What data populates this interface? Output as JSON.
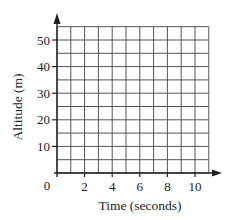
{
  "chart_data": {
    "type": "line",
    "title": "",
    "xlabel": "Time (seconds)",
    "ylabel": "Altitude (m)",
    "xlim": [
      0,
      11
    ],
    "ylim": [
      0,
      55
    ],
    "x_ticks": [
      2,
      4,
      6,
      8,
      10
    ],
    "y_ticks": [
      10,
      20,
      30,
      40,
      50
    ],
    "origin_label": "0",
    "grid": true,
    "grid_x_step": 1,
    "grid_y_step": 5,
    "series": [],
    "legend": null
  },
  "colors": {
    "axis": "#222222",
    "grid": "#555555",
    "background": "#ffffff"
  }
}
